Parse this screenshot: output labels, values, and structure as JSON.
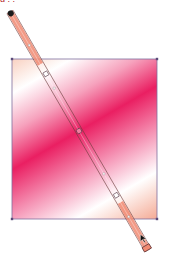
{
  "caption_fragment": "g          ,        ,",
  "artwork": {
    "shape": "rectangle",
    "rect": {
      "x": 12,
      "y": 59,
      "width": 145,
      "height": 160
    },
    "frame_color": "#7f6f9e",
    "gradient": {
      "type": "linear",
      "start": {
        "x": 10,
        "y": 12
      },
      "end": {
        "x": 148,
        "y": 250
      },
      "stops": [
        {
          "offset": 0.0,
          "color": "#f0906a"
        },
        {
          "offset": 0.26,
          "color": "#ffffff"
        },
        {
          "offset": 0.38,
          "color": "#f6a2bd"
        },
        {
          "offset": 0.5,
          "color": "#ea1f62"
        },
        {
          "offset": 0.64,
          "color": "#f594b5"
        },
        {
          "offset": 0.77,
          "color": "#ffffff"
        },
        {
          "offset": 1.0,
          "color": "#ef7c5b"
        }
      ]
    }
  },
  "gradient_annotator": {
    "bar_color": "#f08a72",
    "outline_color": "#6b3a3a",
    "origin_dot_color": "#1a1a1a",
    "midpoint_diamonds": [
      0.14,
      0.32,
      0.68,
      0.86
    ],
    "stop_circles": [
      0.26,
      0.5,
      0.77
    ],
    "end_marker": "square-end-handle",
    "cursor": "arrow-pointer"
  }
}
